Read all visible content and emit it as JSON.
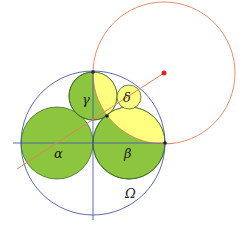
{
  "diagram": {
    "labels": {
      "alpha": "α",
      "beta": "β",
      "gamma": "γ",
      "delta": "δ",
      "omega": "Ω"
    },
    "colors": {
      "green_fill": "#8cc63f",
      "yellow_fill": "#ffff7f",
      "blue_line": "#4a5aa8",
      "red_line": "#e8805a",
      "red_point": "#e82020",
      "dark_point": "#1a2244"
    },
    "circles": {
      "omega": {
        "cx": 93,
        "cy": 143,
        "r": 72
      },
      "alpha": {
        "cx": 57,
        "cy": 143,
        "r": 36
      },
      "beta": {
        "cx": 129,
        "cy": 143,
        "r": 36
      },
      "gamma": {
        "cx": 93,
        "cy": 96,
        "r": 24
      },
      "delta": {
        "cx": 129,
        "cy": 97,
        "r": 12
      },
      "inversion": {
        "cx": 164,
        "cy": 73,
        "r": 71
      }
    }
  }
}
